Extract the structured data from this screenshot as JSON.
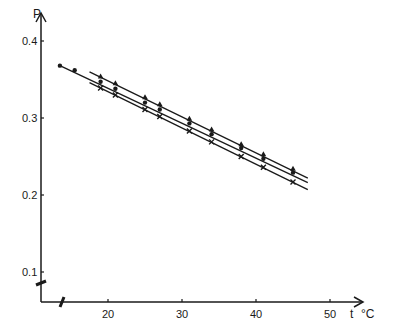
{
  "chart_data": {
    "type": "line",
    "title": "",
    "xlabel": "t °C",
    "ylabel": "P",
    "xlim": [
      11,
      54
    ],
    "ylim": [
      0.06,
      0.42
    ],
    "x_ticks": [
      20,
      30,
      40,
      50
    ],
    "x_tick_labels": [
      "20",
      "30",
      "40",
      "50"
    ],
    "y_ticks": [
      0.1,
      0.2,
      0.3,
      0.4
    ],
    "y_tick_labels": [
      "0.1",
      "0.2",
      "0.3",
      "0.4"
    ],
    "axis_breaks": {
      "x": true,
      "y": true
    },
    "grid": false,
    "legend": null,
    "series": [
      {
        "name": "upper (filled triangles)",
        "marker": "triangle",
        "line": {
          "x": [
            17.5,
            47
          ],
          "y": [
            0.36,
            0.222
          ]
        },
        "points": {
          "x": [
            19,
            21,
            25,
            27,
            31,
            34,
            38,
            41,
            45
          ],
          "y": [
            0.354,
            0.345,
            0.327,
            0.318,
            0.299,
            0.285,
            0.266,
            0.253,
            0.234
          ]
        }
      },
      {
        "name": "middle (filled circles)",
        "marker": "circle",
        "line": {
          "x": [
            13.5,
            47
          ],
          "y": [
            0.368,
            0.216
          ]
        },
        "points": {
          "x": [
            13.5,
            15.5,
            19,
            21,
            25,
            27,
            31,
            34,
            38,
            41,
            45
          ],
          "y": [
            0.368,
            0.362,
            0.347,
            0.338,
            0.32,
            0.311,
            0.293,
            0.279,
            0.261,
            0.247,
            0.229
          ]
        }
      },
      {
        "name": "lower (crosses)",
        "marker": "cross",
        "line": {
          "x": [
            17.5,
            47
          ],
          "y": [
            0.346,
            0.207
          ]
        },
        "points": {
          "x": [
            19,
            21,
            25,
            27,
            31,
            34,
            38,
            41,
            45
          ],
          "y": [
            0.339,
            0.33,
            0.311,
            0.302,
            0.283,
            0.269,
            0.25,
            0.236,
            0.217
          ]
        }
      }
    ]
  },
  "axes": {
    "y_label": "P",
    "x_label_t": "t",
    "x_label_unit": "°C"
  }
}
